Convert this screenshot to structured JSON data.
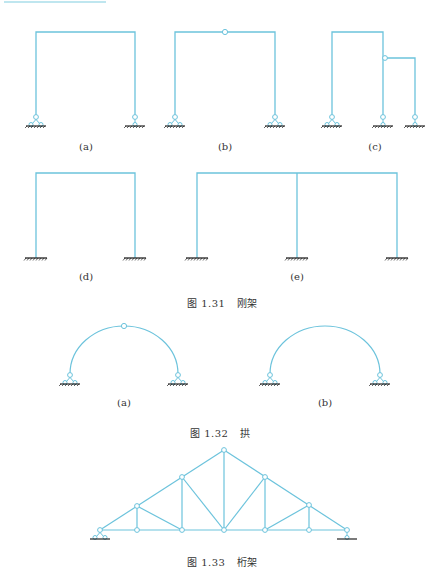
{
  "figure_1_31": {
    "caption_number": "图 1.31",
    "caption_title": "刚架",
    "subfigures": [
      {
        "label": "(a)",
        "type": "frame-two-pinned"
      },
      {
        "label": "(b)",
        "type": "frame-three-hinged"
      },
      {
        "label": "(c)",
        "type": "frame-composite"
      },
      {
        "label": "(d)",
        "type": "frame-fixed"
      },
      {
        "label": "(e)",
        "type": "frame-two-bay-fixed"
      }
    ]
  },
  "figure_1_32": {
    "caption_number": "图 1.32",
    "caption_title": "拱",
    "subfigures": [
      {
        "label": "(a)",
        "type": "three-hinged-arch"
      },
      {
        "label": "(b)",
        "type": "two-hinged-arch"
      }
    ]
  },
  "figure_1_33": {
    "caption_number": "图 1.33",
    "caption_title": "桁架"
  },
  "colors": {
    "member": "#6cc3dc",
    "ground": "#222222",
    "text": "#333333"
  }
}
